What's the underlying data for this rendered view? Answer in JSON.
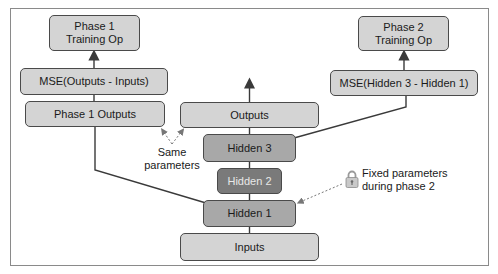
{
  "diagram": {
    "boxes": {
      "phase1_training_op": "Phase 1\nTraining Op",
      "phase2_training_op": "Phase 2\nTraining Op",
      "mse_phase1": "MSE(Outputs - Inputs)",
      "mse_phase2": "MSE(Hidden 3 - Hidden 1)",
      "phase1_outputs": "Phase 1 Outputs",
      "outputs": "Outputs",
      "hidden3": "Hidden 3",
      "hidden2": "Hidden 2",
      "hidden1": "Hidden 1",
      "inputs": "Inputs"
    },
    "annotations": {
      "same_parameters": "Same\nparameters",
      "fixed_parameters": "Fixed parameters\nduring phase 2"
    },
    "icons": {
      "lock": "lock-icon"
    },
    "colors": {
      "light_box": "#d4d4d4",
      "mid_box": "#bdbdbd",
      "hidden_box": "#a8a8a8",
      "frozen_box": "#7a7a7a",
      "line": "#3a3a3a",
      "dashed": "#777777"
    }
  }
}
